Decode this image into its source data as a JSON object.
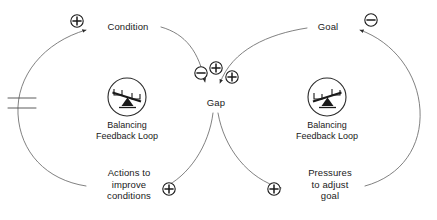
{
  "diagram": {
    "type": "causal-loop-diagram",
    "background_color": "#ffffff",
    "line_color": "#4a4a4a",
    "text_color": "#1a1a1a",
    "variables": [
      {
        "id": "condition",
        "label": "Condition",
        "x": 128,
        "y": 27
      },
      {
        "id": "goal",
        "label": "Goal",
        "x": 328,
        "y": 27
      },
      {
        "id": "gap",
        "label": "Gap",
        "x": 216,
        "y": 103
      },
      {
        "id": "actions",
        "label": "Actions to\nimprove\nconditions",
        "x": 129,
        "y": 190
      },
      {
        "id": "pressures",
        "label": "Pressures\nto adjust\ngoal",
        "x": 330,
        "y": 190
      }
    ],
    "loops": [
      {
        "id": "left-balancing-loop",
        "label": "Balancing\nFeedback Loop",
        "icon": "balancing-scale-icon",
        "cx": 127,
        "cy": 97,
        "r": 19,
        "tilt": "right-down"
      },
      {
        "id": "right-balancing-loop",
        "label": "Balancing\nFeedback Loop",
        "icon": "balancing-scale-icon",
        "cx": 327,
        "cy": 97,
        "r": 19,
        "tilt": "left-down"
      }
    ],
    "polarities": [
      {
        "id": "condition-plus",
        "sign": "+",
        "x": 77,
        "y": 21,
        "on_link": "actions-to-condition"
      },
      {
        "id": "gap-minus",
        "sign": "−",
        "x": 201,
        "y": 73,
        "on_link": "condition-to-gap"
      },
      {
        "id": "gap-plus-top",
        "sign": "+",
        "x": 216,
        "y": 68,
        "on_link": "goal-to-gap"
      },
      {
        "id": "gap-plus-right",
        "sign": "+",
        "x": 232,
        "y": 76,
        "on_link": "goal-to-gap"
      },
      {
        "id": "actions-plus",
        "sign": "+",
        "x": 169,
        "y": 189,
        "on_link": "gap-to-actions"
      },
      {
        "id": "pressures-plus",
        "sign": "+",
        "x": 274,
        "y": 189,
        "on_link": "gap-to-pressures"
      },
      {
        "id": "goal-minus",
        "sign": "−",
        "x": 371,
        "y": 20,
        "on_link": "pressures-to-goal"
      }
    ],
    "delays": [
      {
        "id": "left-loop-delay",
        "marks": 2,
        "x": 22,
        "y": 102
      }
    ],
    "links": [
      {
        "id": "actions-to-condition",
        "from": "actions",
        "to": "condition",
        "polarity": "+",
        "delay": true
      },
      {
        "id": "condition-to-gap",
        "from": "condition",
        "to": "gap",
        "polarity": "−"
      },
      {
        "id": "goal-to-gap",
        "from": "goal",
        "to": "gap",
        "polarity": "+"
      },
      {
        "id": "gap-to-actions",
        "from": "gap",
        "to": "actions",
        "polarity": "+"
      },
      {
        "id": "gap-to-pressures",
        "from": "gap",
        "to": "pressures",
        "polarity": "+"
      },
      {
        "id": "pressures-to-goal",
        "from": "pressures",
        "to": "goal",
        "polarity": "−"
      }
    ]
  }
}
